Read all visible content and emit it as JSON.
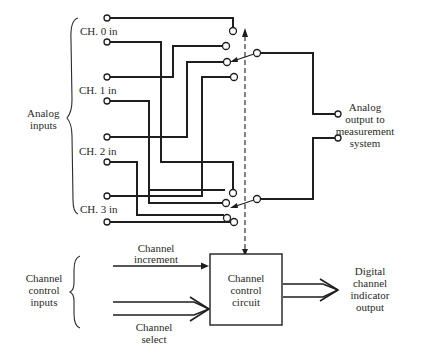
{
  "diagram": {
    "type": "analog multiplexer block diagram",
    "groups": {
      "analog_inputs": "Analog\ninputs",
      "channel_control_inputs": "Channel\ncontrol\ninputs"
    },
    "channels": [
      {
        "label": "CH. 0 in"
      },
      {
        "label": "CH. 1 in"
      },
      {
        "label": "CH. 2 in"
      },
      {
        "label": "CH. 3 in"
      }
    ],
    "analog_output": {
      "label": "Analog\noutput to\nmeasurement\nsystem"
    },
    "control": {
      "increment_label": "Channel\nincrement",
      "select_label": "Channel\nselect",
      "block_label": "Channel\ncontrol\ncircuit",
      "output_label": "Digital\nchannel\nindicator\noutput"
    },
    "text": {
      "ch0": "CH. 0 in",
      "ch1": "CH. 1 in",
      "ch2": "CH. 2 in",
      "ch3": "CH. 3 in",
      "analog_1": "Analog",
      "analog_2": "inputs",
      "out_1": "Analog",
      "out_2": "output to",
      "out_3": "measurement",
      "out_4": "system",
      "ccin_1": "Channel",
      "ccin_2": "control",
      "ccin_3": "inputs",
      "inc_1": "Channel",
      "inc_2": "increment",
      "sel_1": "Channel",
      "sel_2": "select",
      "blk_1": "Channel",
      "blk_2": "control",
      "blk_3": "circuit",
      "dig_1": "Digital",
      "dig_2": "channel",
      "dig_3": "indicator",
      "dig_4": "output"
    },
    "colors": {
      "ink": "#1e1e1e",
      "background": "#ffffff"
    }
  }
}
